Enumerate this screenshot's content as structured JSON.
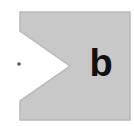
{
  "figure": {
    "label": "b",
    "shape": {
      "fill": "#c8c8c8",
      "stroke": "#b9b9b9",
      "points": "20,12 130,12 130,120 20,120 20,101 70,66 20,31"
    },
    "dot": {
      "cx": 19,
      "cy": 64,
      "r": 1.8,
      "color": "#555555"
    },
    "text_color": "#111111"
  }
}
